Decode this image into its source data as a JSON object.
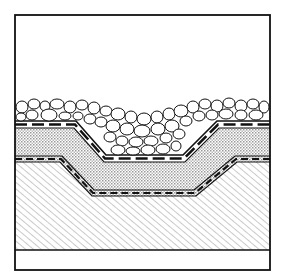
{
  "figure": {
    "type": "cross-section",
    "frame": {
      "x": 15,
      "y": 15,
      "width": 255,
      "height": 255
    },
    "ground_line_y": 250,
    "layers": [
      {
        "name": "stone-riprap",
        "pattern": "rounded-stones"
      },
      {
        "name": "upper-liner",
        "pattern": "dashed-band"
      },
      {
        "name": "fill-layer",
        "pattern": "crosshatch-dots"
      },
      {
        "name": "lower-liner",
        "pattern": "dashed-band"
      },
      {
        "name": "subgrade-soil",
        "pattern": "diagonal-hatch"
      }
    ],
    "colors": {
      "line": "#111111",
      "background": "#ffffff",
      "hatch": "#555555"
    }
  }
}
